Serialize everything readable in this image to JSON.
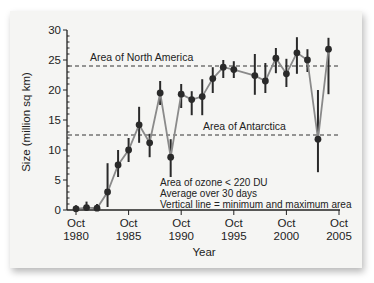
{
  "chart_data": {
    "type": "line",
    "title": "",
    "xlabel": "Year",
    "ylabel": "Size (million sq km)",
    "ylim": [
      0,
      30
    ],
    "xlim": [
      1980,
      2005
    ],
    "grid": false,
    "y_ticks": [
      0,
      5,
      10,
      15,
      20,
      25,
      30
    ],
    "x_ticks": [
      {
        "value": 1980,
        "line1": "Oct",
        "line2": "1980"
      },
      {
        "value": 1985,
        "line1": "Oct",
        "line2": "1985"
      },
      {
        "value": 1990,
        "line1": "Oct",
        "line2": "1990"
      },
      {
        "value": 1995,
        "line1": "Oct",
        "line2": "1995"
      },
      {
        "value": 2000,
        "line1": "Oct",
        "line2": "2000"
      },
      {
        "value": 2005,
        "line1": "Oct",
        "line2": "2005"
      }
    ],
    "series": [
      {
        "name": "Area of ozone < 220 DU (30-day average)",
        "x": [
          1980,
          1981,
          1982,
          1983,
          1984,
          1985,
          1986,
          1987,
          1988,
          1989,
          1990,
          1991,
          1992,
          1993,
          1994,
          1995,
          1997,
          1998,
          1999,
          2000,
          2001,
          2002,
          2003,
          2004
        ],
        "values": [
          0.2,
          0.4,
          0.3,
          3.0,
          7.5,
          10.0,
          14.2,
          11.2,
          19.5,
          8.8,
          19.3,
          18.4,
          18.9,
          21.9,
          23.8,
          23.4,
          22.4,
          21.5,
          25.3,
          22.7,
          26.2,
          25.0,
          11.8,
          26.8
        ],
        "min": [
          0.0,
          0.0,
          0.0,
          0.5,
          5.5,
          8.0,
          11.2,
          8.8,
          17.5,
          5.5,
          17.0,
          15.8,
          15.8,
          19.5,
          22.0,
          22.0,
          19.2,
          19.5,
          22.8,
          20.5,
          22.7,
          23.0,
          6.3,
          19.3
        ],
        "max": [
          0.8,
          1.4,
          1.0,
          7.8,
          10.0,
          12.0,
          17.2,
          12.7,
          21.5,
          11.8,
          21.0,
          19.8,
          21.8,
          23.8,
          25.0,
          24.8,
          26.0,
          24.5,
          27.0,
          25.2,
          28.8,
          26.8,
          20.0,
          28.7
        ]
      }
    ],
    "reference_lines": [
      {
        "label": "Area of North America",
        "value": 24.0
      },
      {
        "label": "Area of Antarctica",
        "value": 12.5
      }
    ],
    "annotations": [
      "Area of ozone < 220 DU",
      "Average over 30 days",
      "Vertical line = minimum and maximum area"
    ],
    "legend": "none"
  }
}
